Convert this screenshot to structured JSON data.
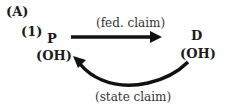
{
  "panel_label": "(A)",
  "scenario_number": "(1)",
  "nodes": [
    {
      "id": "P",
      "label": "P",
      "sublabel": "(OH)"
    },
    {
      "id": "D",
      "label": "D",
      "sublabel": "(OH)"
    }
  ],
  "edges": [
    {
      "from": "P",
      "to": "D",
      "label": "(fed. claim)",
      "style": "straight"
    },
    {
      "from": "D",
      "to": "P",
      "label": "(state claim)",
      "style": "curved"
    }
  ],
  "colors": {
    "ink": "#1a1a1a",
    "background": "#ffffff"
  }
}
